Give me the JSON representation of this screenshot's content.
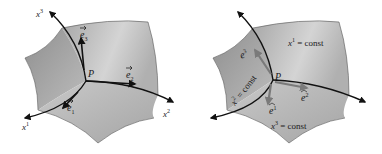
{
  "colors": {
    "surface_light": "#d9d9d9",
    "surface_mid": "#b3b3b3",
    "surface_dark": "#9a9a9a",
    "curve": "#111111",
    "covariant_vector": "#111111",
    "contravariant_vector": "#7a7a7a",
    "background": "#ffffff"
  },
  "left_panel": {
    "point_label": "P",
    "axes": [
      {
        "base": "x",
        "sup": "1"
      },
      {
        "base": "x",
        "sup": "2"
      },
      {
        "base": "x",
        "sup": "3"
      }
    ],
    "vectors": [
      {
        "base": "e",
        "sub": "1"
      },
      {
        "base": "e",
        "sub": "2"
      },
      {
        "base": "e",
        "sub": "3"
      }
    ]
  },
  "right_panel": {
    "point_label": "P",
    "surfaces": [
      {
        "base": "x",
        "sup": "1",
        "rest": " = const"
      },
      {
        "base": "x",
        "sup": "2",
        "rest": " = const"
      },
      {
        "base": "x",
        "sup": "3",
        "rest": " = const"
      }
    ],
    "vectors": [
      {
        "base": "e",
        "sup": "1"
      },
      {
        "base": "e",
        "sup": "2"
      },
      {
        "base": "e",
        "sup": "3"
      }
    ]
  }
}
